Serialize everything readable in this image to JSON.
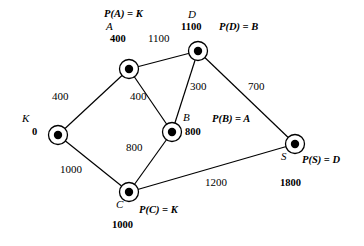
{
  "diagram": {
    "colors": {
      "background": "#ffffff",
      "stroke": "#000000",
      "node_fill": "#000000"
    },
    "nodes": [
      {
        "id": "K",
        "label": "K",
        "distance": "0",
        "predecessor": null,
        "cx": 58,
        "cy": 135
      },
      {
        "id": "A",
        "label": "A",
        "distance": "400",
        "predecessor": "P(A) = K",
        "cx": 129,
        "cy": 69
      },
      {
        "id": "D",
        "label": "D",
        "distance": "1100",
        "predecessor": "P(D) = B",
        "cx": 198,
        "cy": 51
      },
      {
        "id": "B",
        "label": "B",
        "distance": "800",
        "predecessor": "P(B) = A",
        "cx": 172,
        "cy": 132
      },
      {
        "id": "C",
        "label": "C",
        "distance": "1000",
        "predecessor": "P(C) = K",
        "cx": 129,
        "cy": 192
      },
      {
        "id": "S",
        "label": "S",
        "distance": "1800",
        "predecessor": "P(S) = D",
        "cx": 295,
        "cy": 144
      }
    ],
    "edges": [
      {
        "from": "K",
        "to": "A",
        "weight": "400",
        "lx": 52,
        "ly": 91
      },
      {
        "from": "K",
        "to": "C",
        "weight": "1000",
        "lx": 60,
        "ly": 164
      },
      {
        "from": "A",
        "to": "D",
        "weight": "1100",
        "lx": 148,
        "ly": 33
      },
      {
        "from": "A",
        "to": "B",
        "weight": "400",
        "lx": 130,
        "ly": 91
      },
      {
        "from": "B",
        "to": "D",
        "weight": "300",
        "lx": 190,
        "ly": 81
      },
      {
        "from": "B",
        "to": "C",
        "weight": "800",
        "lx": 126,
        "ly": 142
      },
      {
        "from": "D",
        "to": "S",
        "weight": "700",
        "lx": 248,
        "ly": 81
      },
      {
        "from": "C",
        "to": "S",
        "weight": "1200",
        "lx": 205,
        "ly": 177
      }
    ],
    "annotations": {
      "node_label_positions": [
        {
          "id": "K",
          "label_x": 22,
          "label_y": 113,
          "dist_x": 32,
          "dist_y": 127,
          "pred_x": null,
          "pred_y": null
        },
        {
          "id": "A",
          "label_x": 106,
          "label_y": 21,
          "dist_x": 110,
          "dist_y": 34,
          "pred_x": 104,
          "pred_y": 9
        },
        {
          "id": "D",
          "label_x": 188,
          "label_y": 9,
          "dist_x": 181,
          "dist_y": 22,
          "pred_x": 219,
          "pred_y": 22
        },
        {
          "id": "B",
          "label_x": 183,
          "label_y": 112,
          "dist_x": 185,
          "dist_y": 127,
          "pred_x": 212,
          "pred_y": 114
        },
        {
          "id": "C",
          "label_x": 116,
          "label_y": 199,
          "dist_x": 112,
          "dist_y": 220,
          "pred_x": 139,
          "pred_y": 205
        },
        {
          "id": "S",
          "label_x": 281,
          "label_y": 151,
          "dist_x": 280,
          "dist_y": 178,
          "pred_x": 302,
          "pred_y": 155
        }
      ]
    }
  }
}
